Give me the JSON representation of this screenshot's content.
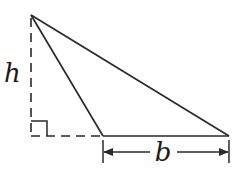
{
  "diagram": {
    "labels": {
      "height": "h",
      "base": "b"
    },
    "colors": {
      "stroke": "#2a2a2a",
      "background": "#ffffff"
    },
    "geometry": {
      "apex": [
        31,
        15
      ],
      "base_left": [
        103,
        136
      ],
      "base_right": [
        229,
        136
      ],
      "foot_of_altitude": [
        31,
        136
      ]
    }
  }
}
